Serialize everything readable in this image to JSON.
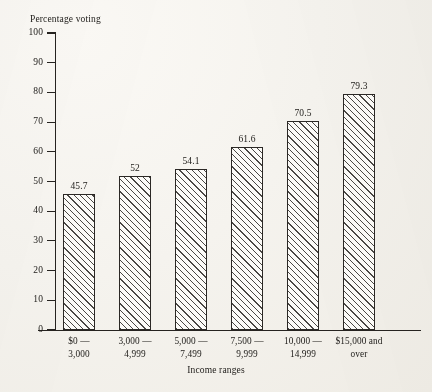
{
  "figure": {
    "kind": "scanned-textbook-bar-chart",
    "background_color": "#f6f4ef",
    "ink_color": "#262320"
  },
  "chart_data": {
    "type": "bar",
    "title": "",
    "ylabel": "Percentage voting",
    "xlabel": "Income ranges",
    "categories": [
      "$0 – 3,000",
      "3,000 – 4,999",
      "5,000 – 7,499",
      "7,500 – 9,999",
      "10,000 – 14,999",
      "$15,000 and over"
    ],
    "category_lines": [
      {
        "line1": "$0 —",
        "line2": "3,000"
      },
      {
        "line1": "3,000 —",
        "line2": "4,999"
      },
      {
        "line1": "5,000 —",
        "line2": "7,499"
      },
      {
        "line1": "7,500 —",
        "line2": "9,999"
      },
      {
        "line1": "10,000 —",
        "line2": "14,999"
      },
      {
        "line1": "$15,000 and",
        "line2": "over"
      }
    ],
    "values": [
      45.7,
      52,
      54.1,
      61.6,
      70.5,
      79.3
    ],
    "value_labels": [
      "45.7",
      "52",
      "54.1",
      "61.6",
      "70.5",
      "79.3"
    ],
    "ylim": [
      0,
      100
    ],
    "ytick_step": 10,
    "ytick_labels": [
      "0",
      "10",
      "20",
      "30",
      "40",
      "50",
      "60",
      "70",
      "80",
      "90",
      "100"
    ],
    "grid": false,
    "legend": null,
    "bar_fill": "diagonal-hatch",
    "bar_outline_color": "#2b2825"
  }
}
